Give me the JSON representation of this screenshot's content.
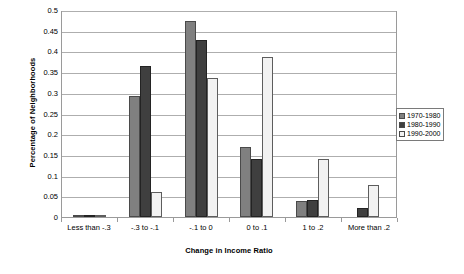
{
  "chart_data": {
    "type": "bar",
    "title": "",
    "subtitle": "",
    "xlabel": "Change in Income Ratio",
    "ylabel": "Percentage of Neighborhoods",
    "categories": [
      "Less than -.3",
      "-.3 to -.1",
      "-.1 to 0",
      "0 to .1",
      "1 to .2",
      "More than .2"
    ],
    "series": [
      {
        "name": "1970-1980",
        "color": "#808080",
        "values": [
          0.004,
          0.293,
          0.473,
          0.17,
          0.038,
          0.0
        ]
      },
      {
        "name": "1980-1990",
        "color": "#3f3f3f",
        "values": [
          0.006,
          0.364,
          0.428,
          0.139,
          0.041,
          0.022
        ]
      },
      {
        "name": "1990-2000",
        "color": "#f2f2f2",
        "values": [
          0.001,
          0.061,
          0.335,
          0.386,
          0.139,
          0.077
        ]
      }
    ],
    "ylim": [
      0,
      0.5
    ],
    "yticks": [
      0,
      0.05,
      0.1,
      0.15,
      0.2,
      0.25,
      0.3,
      0.35,
      0.4,
      0.45,
      0.5
    ],
    "ytick_labels": [
      "0",
      "0.05",
      "0.1",
      "0.15",
      "0.2",
      "0.25",
      "0.3",
      "0.35",
      "0.4",
      "0.45",
      "0.5"
    ],
    "grid": "horizontal",
    "legend_position": "right",
    "plot_border": true
  }
}
